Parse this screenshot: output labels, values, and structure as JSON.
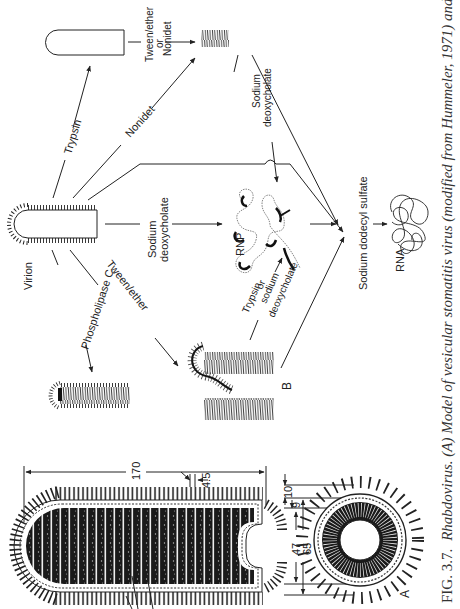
{
  "figure": {
    "orientation": "rotated-90-ccw",
    "caption": {
      "fig_label": "FIG. 3.7.",
      "text_italic": "Rhabdovirus. (A) Model of vesicular stomatitis virus (modified from Hummeler, 1971) and (B) dis-",
      "visible_fragment": "Fig. 3.7. Rhabdovirus. (A) Model of vesicular stomatitis virus (modified from Hummeler, 1971) and (B) dis-"
    },
    "panels": {
      "a_label": "A",
      "b_label": "B"
    },
    "panel_a": {
      "dimensions": {
        "length": "170",
        "spacing": "4.5",
        "outer_layer": "10",
        "membrane": "9",
        "inner_diameter": "47",
        "outer_diameter": "65"
      }
    },
    "panel_b": {
      "nodes": {
        "virion": "Virion",
        "rnp": "RNP",
        "rna": "RNA"
      },
      "treatments": {
        "trypsin": "Trypsin",
        "nonidet": "Nonidet",
        "tween_ether_or_nonidet": [
          "Tween/ether",
          "or",
          "Nonidet"
        ],
        "sodium_deoxycholate_top": [
          "Sodium",
          "deoxycholate"
        ],
        "sodium_deoxycholate_mid": [
          "Sodium",
          "deoxycholate"
        ],
        "phospholipase_c": "Phospholipase C",
        "tween_ether": "Tween/ether",
        "trypsin_or_sodium_deoxycholate": [
          "Trypsin",
          "or",
          "sodium",
          "deoxycholate"
        ],
        "sodium_dodecyl_sulfate": "Sodium dodecyl sulfate"
      }
    }
  }
}
